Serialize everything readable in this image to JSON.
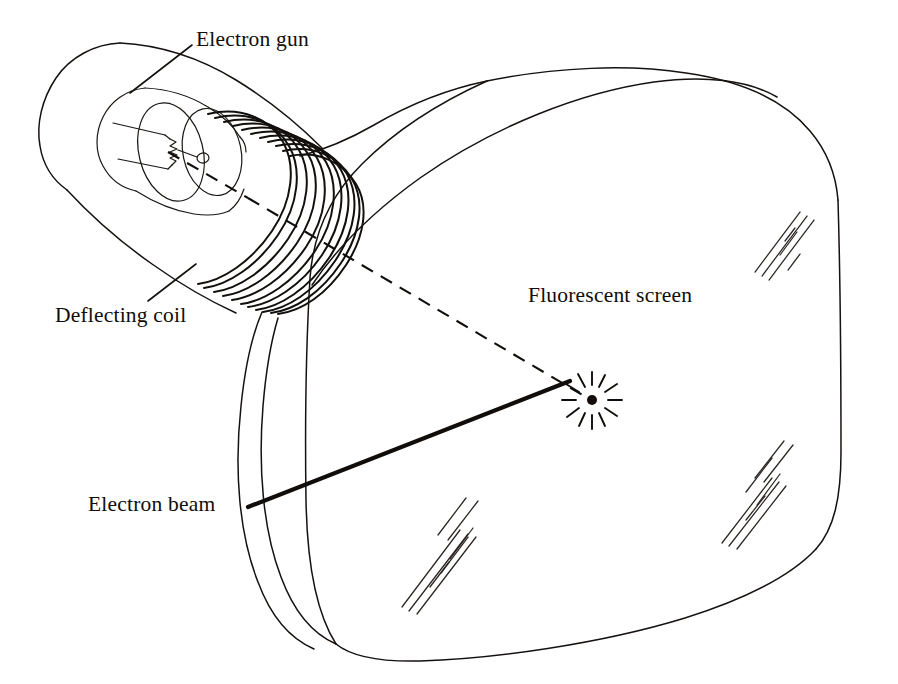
{
  "figure": {
    "background_color": "#ffffff",
    "ink_color": "#100d0b",
    "width": 898,
    "height": 684
  },
  "labels": {
    "electron_gun": "Electron gun",
    "deflecting_coil": "Deflecting coil",
    "electron_beam": "Electron beam",
    "fluorescent_screen": "Fluorescent screen"
  },
  "parts": {
    "envelope": "glass-envelope-outline",
    "neck": "tube-neck",
    "gun_cylinder": "electron-gun-cylinder",
    "filament": "cathode-filament-zigzag",
    "anode_disc": "anode-disc-with-aperture",
    "coil_windings": "deflecting-coil-helix",
    "funnel": "flare-funnel",
    "screen_face": "fluorescent-screen-face",
    "axis": "undeflected-axis-dashed",
    "beam": "deflected-electron-beam",
    "spot": "glowing-spot-on-screen",
    "glare_marks": "screen-glass-reflection-hatching"
  },
  "counts": {
    "coil_turns": 11,
    "spot_rays": 12,
    "glare_groups": 3
  }
}
